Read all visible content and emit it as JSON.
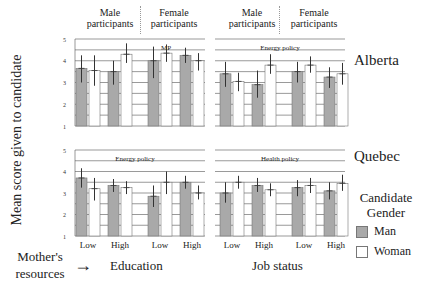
{
  "chart_data": {
    "type": "bar",
    "title": "",
    "ylabel": "Mean score given to candidate",
    "ylim": [
      1,
      5
    ],
    "yticks": [
      1,
      2,
      3,
      4,
      5
    ],
    "grid": true,
    "legend": {
      "title": "Candidate Gender",
      "position": "right",
      "entries": [
        {
          "label": "Man",
          "color": "#a9a9a9"
        },
        {
          "label": "Woman",
          "color": "#ffffff"
        }
      ]
    },
    "column_groups": [
      "Male participants",
      "Female participants"
    ],
    "x_factor_label": "Mother's resources",
    "rows": [
      "Alberta",
      "Quebec"
    ],
    "columns": [
      "Education",
      "Job status"
    ],
    "panels": [
      {
        "row": "Alberta",
        "column": "Education",
        "panel_title": "MP",
        "categories": [
          "Male participants - Low",
          "Male participants - High",
          "Female participants - Low",
          "Female participants - High"
        ],
        "xtick_labels": [
          "Low",
          "High",
          "Low",
          "High"
        ],
        "series": [
          {
            "name": "Man",
            "values": [
              3.65,
              3.5,
              4.0,
              4.25
            ],
            "ci_low": [
              3.0,
              2.9,
              3.2,
              3.9
            ],
            "ci_high": [
              4.25,
              4.0,
              4.65,
              4.6
            ]
          },
          {
            "name": "Woman",
            "values": [
              3.55,
              4.3,
              4.35,
              4.0
            ],
            "ci_low": [
              2.85,
              3.9,
              3.95,
              3.55
            ],
            "ci_high": [
              4.25,
              4.8,
              4.75,
              4.35
            ]
          }
        ]
      },
      {
        "row": "Alberta",
        "column": "Job status",
        "panel_title": "Energy policy",
        "categories": [
          "Male participants - Low",
          "Male participants - High",
          "Female participants - Low",
          "Female participants - High"
        ],
        "xtick_labels": [
          "Low",
          "High",
          "Low",
          "High"
        ],
        "series": [
          {
            "name": "Man",
            "values": [
              3.4,
              2.9,
              3.5,
              3.25
            ],
            "ci_low": [
              2.8,
              2.3,
              3.0,
              2.75
            ],
            "ci_high": [
              3.95,
              3.55,
              3.95,
              3.7
            ]
          },
          {
            "name": "Woman",
            "values": [
              3.05,
              3.8,
              3.8,
              3.4
            ],
            "ci_low": [
              2.6,
              3.4,
              3.45,
              2.9
            ],
            "ci_high": [
              3.45,
              4.3,
              4.2,
              3.9
            ]
          }
        ]
      },
      {
        "row": "Quebec",
        "column": "Education",
        "panel_title": "Energy policy",
        "categories": [
          "Male participants - Low",
          "Male participants - High",
          "Female participants - Low",
          "Female participants - High"
        ],
        "xtick_labels": [
          "Low",
          "High",
          "Low",
          "High"
        ],
        "series": [
          {
            "name": "Man",
            "values": [
              3.7,
              3.35,
              2.85,
              3.5
            ],
            "ci_low": [
              3.25,
              3.05,
              2.35,
              3.2
            ],
            "ci_high": [
              4.15,
              3.65,
              3.35,
              3.8
            ]
          },
          {
            "name": "Woman",
            "values": [
              3.2,
              3.25,
              3.5,
              3.0
            ],
            "ci_low": [
              2.65,
              2.95,
              2.95,
              2.7
            ],
            "ci_high": [
              3.7,
              3.55,
              4.0,
              3.35
            ]
          }
        ]
      },
      {
        "row": "Quebec",
        "column": "Job status",
        "panel_title": "Health policy",
        "categories": [
          "Male participants - Low",
          "Male participants - High",
          "Female participants - Low",
          "Female participants - High"
        ],
        "xtick_labels": [
          "Low",
          "High",
          "Low",
          "High"
        ],
        "series": [
          {
            "name": "Man",
            "values": [
              3.0,
              3.35,
              3.25,
              3.1
            ],
            "ci_low": [
              2.55,
              3.05,
              2.85,
              2.7
            ],
            "ci_high": [
              3.5,
              3.7,
              3.6,
              3.5
            ]
          },
          {
            "name": "Woman",
            "values": [
              3.5,
              3.15,
              3.35,
              3.45
            ],
            "ci_low": [
              3.2,
              2.85,
              3.0,
              3.1
            ],
            "ci_high": [
              3.8,
              3.45,
              3.7,
              3.85
            ]
          }
        ]
      }
    ]
  },
  "labels": {
    "ylabel": "Mean score given to candidate",
    "male_participants": "Male participants",
    "female_participants": "Female participants",
    "row_alberta": "Alberta",
    "row_quebec": "Quebec",
    "legend_title": "Candidate Gender",
    "legend_man": "Man",
    "legend_woman": "Woman",
    "mothers_resources": "Mother's resources",
    "arrow": "→",
    "education": "Education",
    "job_status": "Job status",
    "xtick_low": "Low",
    "xtick_high": "High"
  },
  "colors": {
    "man_fill": "#a9a9a9",
    "woman_fill": "#ffffff",
    "grid": "#555555",
    "bar_edge": "#777777",
    "error_bar": "#333333"
  }
}
